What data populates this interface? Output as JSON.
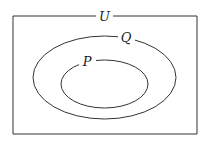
{
  "diagram": {
    "type": "venn",
    "universe": {
      "label": "U"
    },
    "sets": [
      {
        "label": "Q",
        "contains": [
          "P"
        ]
      },
      {
        "label": "P"
      }
    ],
    "colors": {
      "stroke": "#333333",
      "background": "#ffffff"
    }
  }
}
